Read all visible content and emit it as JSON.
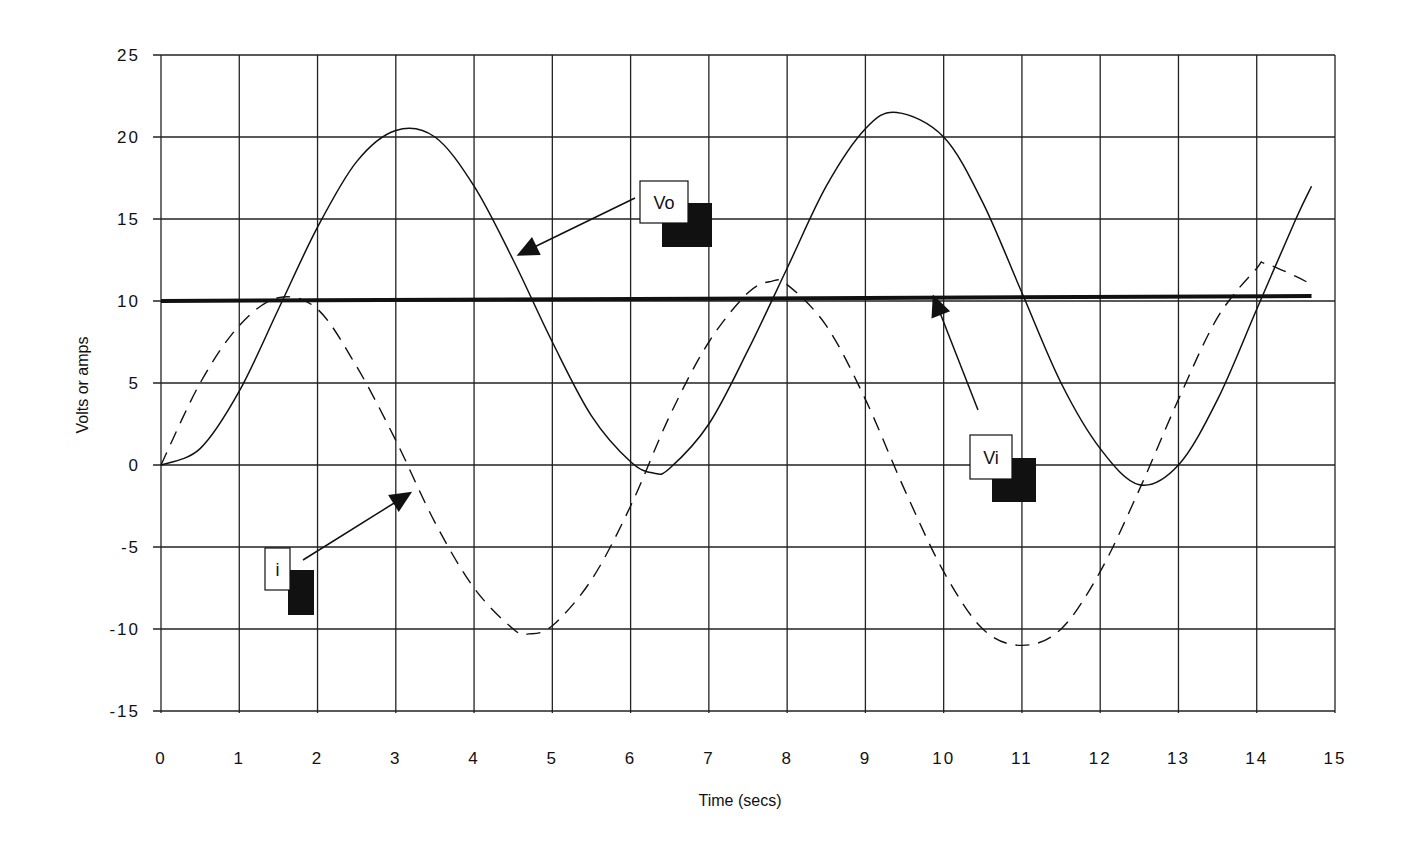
{
  "chart_data": {
    "type": "line",
    "title": "",
    "xlabel": "Time (secs)",
    "ylabel": "Volts or amps",
    "xlim": [
      0,
      15
    ],
    "ylim": [
      -15,
      25
    ],
    "x_ticks": [
      0,
      1,
      2,
      3,
      4,
      5,
      6,
      7,
      8,
      9,
      10,
      11,
      12,
      13,
      14,
      15
    ],
    "y_ticks": [
      25,
      20,
      15,
      10,
      5,
      0,
      -5,
      -10,
      -15
    ],
    "grid": true,
    "legend": "callout labels with arrows (no legend box)",
    "series": [
      {
        "name": "Vo",
        "style": "solid-thin",
        "x": [
          0,
          0.5,
          1,
          1.5,
          2,
          2.5,
          3,
          3.5,
          4,
          4.5,
          5,
          5.5,
          6,
          6.3,
          6.5,
          7,
          7.5,
          8,
          8.5,
          9,
          9.4,
          10,
          10.5,
          11,
          11.5,
          12,
          12.5,
          13,
          13.5,
          14,
          14.5,
          14.7
        ],
        "values": [
          0,
          1,
          4.5,
          9.5,
          14.5,
          18.5,
          20.4,
          20,
          17,
          12.5,
          7.5,
          3,
          0.2,
          -0.5,
          -0.2,
          2.5,
          7,
          12,
          17,
          20.5,
          21.5,
          20,
          16,
          10.5,
          5,
          1,
          -1.2,
          0,
          4,
          9.5,
          15,
          17
        ]
      },
      {
        "name": "i",
        "style": "dashed",
        "x": [
          0,
          0.5,
          1,
          1.5,
          2,
          2.5,
          3,
          3.5,
          4,
          4.5,
          4.7,
          5,
          5.5,
          6,
          6.5,
          7,
          7.5,
          7.8,
          8,
          8.5,
          9,
          9.5,
          10,
          10.5,
          11,
          11.5,
          12,
          12.5,
          13,
          13.5,
          14,
          14.1,
          14.5,
          14.7
        ],
        "values": [
          0,
          5,
          8.5,
          10.2,
          9.5,
          6,
          1.5,
          -3.5,
          -7.5,
          -10,
          -10.3,
          -9.8,
          -7,
          -2.5,
          3,
          7.5,
          10.5,
          11.2,
          11,
          8.5,
          4,
          -1.5,
          -6.5,
          -10,
          -11,
          -10,
          -6.5,
          -1.5,
          4,
          9,
          12,
          12.3,
          11.5,
          11
        ]
      },
      {
        "name": "Vi",
        "style": "solid-thick",
        "x": [
          0,
          14.7
        ],
        "values": [
          10,
          10.3
        ]
      }
    ],
    "annotations": [
      {
        "label": "Vo",
        "box_x": 6.3,
        "box_y": 16,
        "arrow_to_x": 4.5,
        "arrow_to_y": 13
      },
      {
        "label": "Vi",
        "box_x": 10.5,
        "box_y": 0.5,
        "arrow_to_x": 9.7,
        "arrow_to_y": 10
      },
      {
        "label": "i",
        "box_x": 1.4,
        "box_y": -6.5,
        "arrow_to_x": 3.1,
        "arrow_to_y": -2
      }
    ]
  },
  "axes": {
    "x_title": "Time (secs)",
    "y_title": "Volts or amps",
    "x_tick_labels": [
      "0",
      "1",
      "2",
      "3",
      "4",
      "5",
      "6",
      "7",
      "8",
      "9",
      "10",
      "11",
      "12",
      "13",
      "14",
      "15"
    ],
    "y_tick_labels": [
      "25",
      "20",
      "15",
      "10",
      "5",
      "0",
      "-5",
      "-10",
      "-15"
    ]
  },
  "callouts": {
    "vo": "Vo",
    "vi": "Vi",
    "i": "i"
  },
  "colors": {
    "ink": "#111111",
    "grid": "#222222",
    "background": "#ffffff"
  }
}
